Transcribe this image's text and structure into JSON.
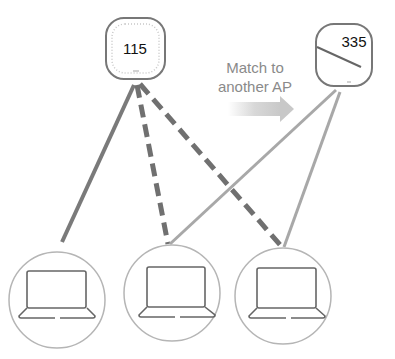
{
  "diagram": {
    "access_points": [
      {
        "id": "ap-115",
        "label": "115"
      },
      {
        "id": "ap-335",
        "label": "335"
      }
    ],
    "annotation": {
      "line1": "Match to",
      "line2": "another AP"
    },
    "clients": [
      {
        "id": "client-1"
      },
      {
        "id": "client-2"
      },
      {
        "id": "client-3"
      }
    ],
    "colors": {
      "solid_link": "#7a7a7a",
      "dashed_link": "#707070",
      "light_link": "#a8a8a8",
      "outline": "#777777",
      "circle": "#b5b5b5"
    }
  }
}
